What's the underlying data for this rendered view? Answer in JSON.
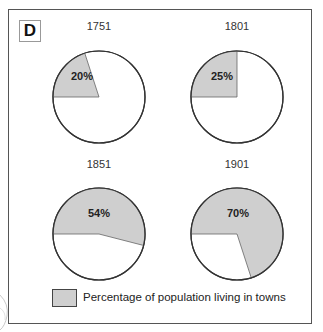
{
  "panel_label": "D",
  "legend": {
    "label": "Percentage of population living in towns",
    "swatch_color": "#cfcfcf"
  },
  "colors": {
    "shaded": "#cfcfcf",
    "unshaded": "#ffffff",
    "outline": "#333333"
  },
  "pies": [
    {
      "year": "1751",
      "value": 20,
      "label": "20%"
    },
    {
      "year": "1801",
      "value": 25,
      "label": "25%"
    },
    {
      "year": "1851",
      "value": 54,
      "label": "54%"
    },
    {
      "year": "1901",
      "value": 70,
      "label": "70%"
    }
  ],
  "chart_data": {
    "type": "pie",
    "title": "",
    "panel": "D",
    "categories": [
      "1751",
      "1801",
      "1851",
      "1901"
    ],
    "series": [
      {
        "name": "Percentage of population living in towns",
        "values": [
          20,
          25,
          54,
          70
        ]
      },
      {
        "name": "Other",
        "values": [
          80,
          75,
          46,
          30
        ]
      }
    ],
    "legend": [
      "Percentage of population living in towns"
    ],
    "legend_position": "bottom"
  }
}
